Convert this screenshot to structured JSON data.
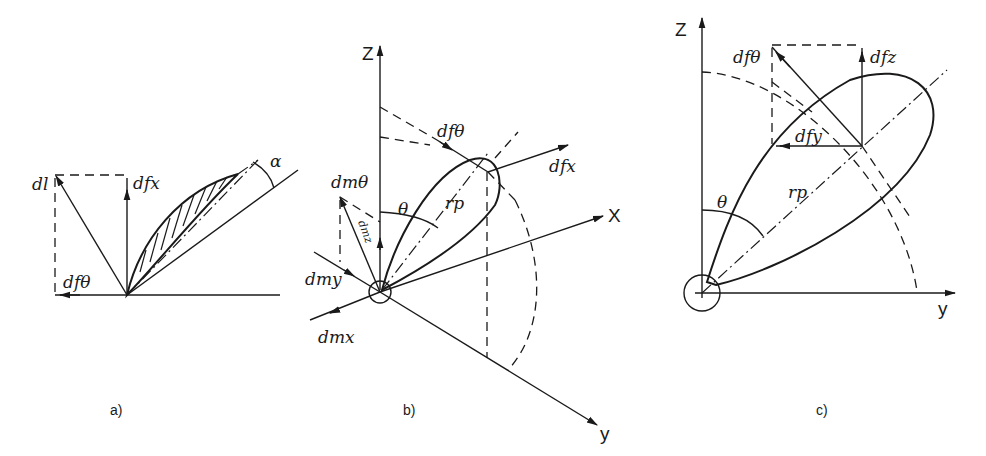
{
  "figure": {
    "panels": [
      {
        "id": "a",
        "caption": "a)",
        "labels": {
          "dl": "dl",
          "df_x": "dfx",
          "df_theta": "dfθ",
          "alpha": "α"
        }
      },
      {
        "id": "b",
        "caption": "b)",
        "labels": {
          "axis_z": "Z",
          "axis_x": "X",
          "axis_y": "y",
          "df_theta": "dfθ",
          "df_x": "dfx",
          "dm_theta": "dmθ",
          "dm_z": "dmz",
          "dm_y": "dmy",
          "dm_x": "dmx",
          "theta": "θ",
          "r_p": "rp"
        }
      },
      {
        "id": "c",
        "caption": "c)",
        "labels": {
          "axis_z": "Z",
          "axis_y": "y",
          "df_theta": "dfθ",
          "df_z": "dfz",
          "df_y": "dfy",
          "theta": "θ",
          "r_p": "rp"
        }
      }
    ]
  }
}
